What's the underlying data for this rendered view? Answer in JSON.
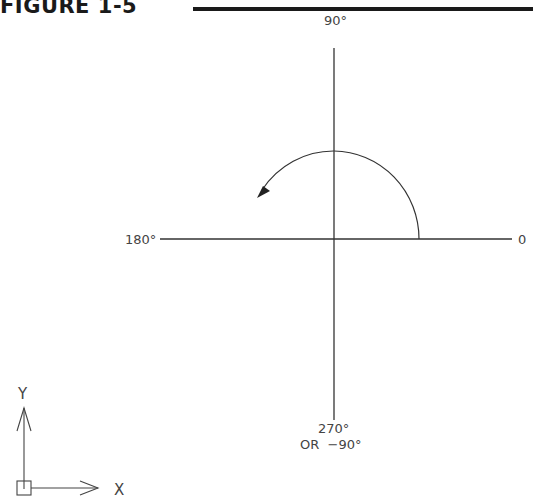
{
  "figure": {
    "title": "FIGURE 1-5"
  },
  "diagram": {
    "angles": {
      "deg0": "0",
      "deg90": "90°",
      "deg180": "180°",
      "deg270": "270°",
      "deg270_alt": "OR  −90°"
    },
    "ucs_icon": {
      "x_label": "X",
      "y_label": "Y"
    },
    "arc": {
      "direction": "counterclockwise",
      "from_angle": 0,
      "to_angle": 150
    }
  }
}
